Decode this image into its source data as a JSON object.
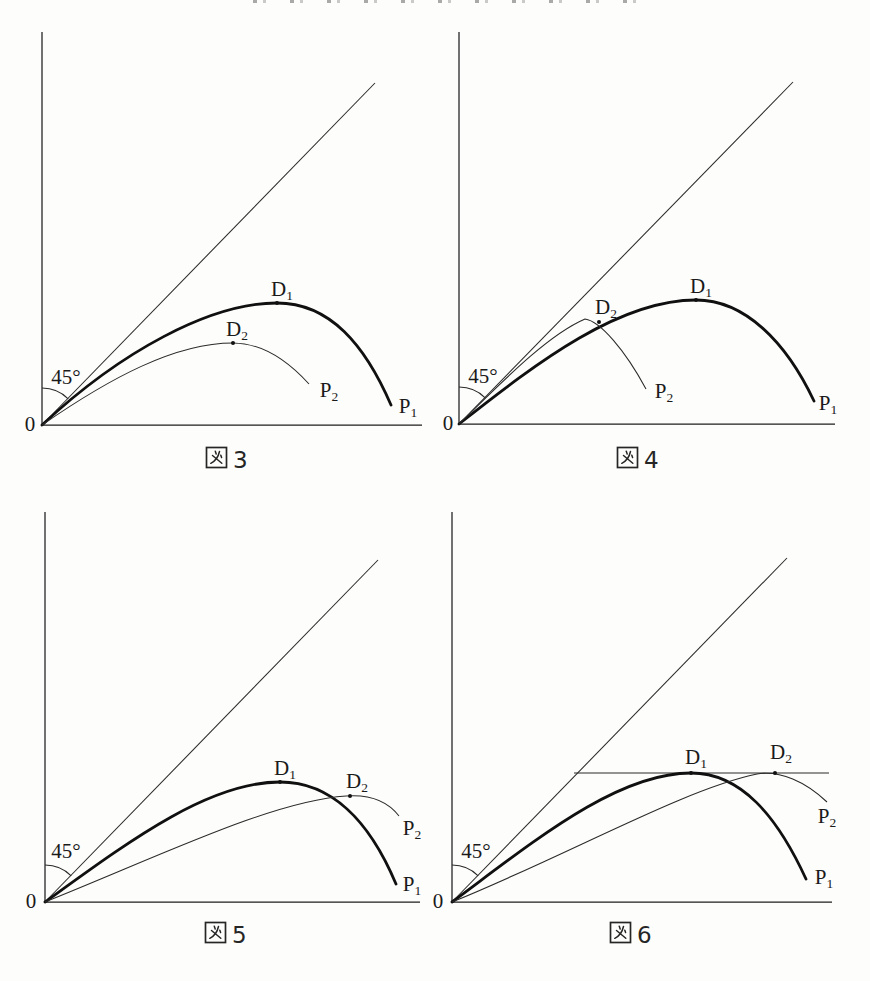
{
  "page": {
    "background": "#fdfdfb",
    "line_color": "#1f1f1f"
  },
  "figures": [
    {
      "id": "fig-3",
      "caption_kanji": "図",
      "caption_number": "3",
      "origin": "0",
      "angle": "45°",
      "d1": {
        "base": "D",
        "sub": "1"
      },
      "d2": {
        "base": "D",
        "sub": "2"
      },
      "p1": {
        "base": "P",
        "sub": "1"
      },
      "p2": {
        "base": "P",
        "sub": "2"
      }
    },
    {
      "id": "fig-4",
      "caption_kanji": "図",
      "caption_number": "4",
      "origin": "0",
      "angle": "45°",
      "d1": {
        "base": "D",
        "sub": "1"
      },
      "d2": {
        "base": "D",
        "sub": "2"
      },
      "p1": {
        "base": "P",
        "sub": "1"
      },
      "p2": {
        "base": "P",
        "sub": "2"
      }
    },
    {
      "id": "fig-5",
      "caption_kanji": "図",
      "caption_number": "5",
      "origin": "0",
      "angle": "45°",
      "d1": {
        "base": "D",
        "sub": "1"
      },
      "d2": {
        "base": "D",
        "sub": "2"
      },
      "p1": {
        "base": "P",
        "sub": "1"
      },
      "p2": {
        "base": "P",
        "sub": "2"
      }
    },
    {
      "id": "fig-6",
      "caption_kanji": "図",
      "caption_number": "6",
      "origin": "0",
      "angle": "45°",
      "d1": {
        "base": "D",
        "sub": "1"
      },
      "d2": {
        "base": "D",
        "sub": "2"
      },
      "p1": {
        "base": "P",
        "sub": "1"
      },
      "p2": {
        "base": "P",
        "sub": "2"
      }
    }
  ]
}
